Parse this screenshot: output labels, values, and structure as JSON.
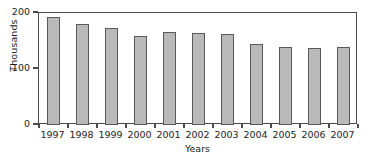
{
  "chart_data": {
    "type": "bar",
    "title": "",
    "xlabel": "Years",
    "ylabel": "Thousands",
    "categories": [
      "1997",
      "1998",
      "1999",
      "2000",
      "2001",
      "2002",
      "2003",
      "2004",
      "2005",
      "2006",
      "2007"
    ],
    "values": [
      193,
      181,
      174,
      159,
      166,
      165,
      162,
      145,
      140,
      138,
      140
    ],
    "series": [
      {
        "name": "Count",
        "values": [
          193,
          181,
          174,
          159,
          166,
          165,
          162,
          145,
          140,
          138,
          140
        ]
      }
    ],
    "ylim": [
      0,
      200
    ],
    "yticks": [
      0,
      100,
      200
    ],
    "ytick_labels": [
      "0",
      "100",
      "200"
    ],
    "grid": false,
    "legend": false,
    "legend_position": "none",
    "bar_fill_color": "#b9b9b9",
    "bar_edge_color": "#595959",
    "axis_color": "#4a4a4a",
    "background_color": "#ffffff"
  },
  "axes": {
    "y_title": "Thousands",
    "x_title": "Years"
  }
}
